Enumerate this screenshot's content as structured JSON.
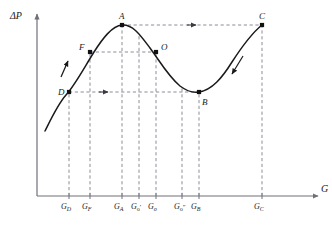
{
  "figure": {
    "axes": {
      "y_label": "ΔP",
      "x_label": "G",
      "origin_px": [
        37,
        196
      ],
      "x_axis_end_px": [
        318,
        196
      ],
      "y_axis_end_px": [
        37,
        14
      ]
    },
    "style": {
      "curve_color": "#1a1a1a",
      "dash_color": "#8c8c99",
      "axis_color": "#6f6f78",
      "point_color": "#111111",
      "background": "#ffffff"
    },
    "x_ticks": [
      {
        "name": "G_D",
        "base": "G",
        "sub": "D",
        "primes": "",
        "x_px": 69
      },
      {
        "name": "G_F",
        "base": "G",
        "sub": "F",
        "primes": "",
        "x_px": 90
      },
      {
        "name": "G_A",
        "base": "G",
        "sub": "A",
        "primes": "",
        "x_px": 122
      },
      {
        "name": "G_o'",
        "base": "G",
        "sub": "o",
        "primes": "′",
        "x_px": 139
      },
      {
        "name": "G_o",
        "base": "G",
        "sub": "o",
        "primes": "",
        "x_px": 156
      },
      {
        "name": "G_o''",
        "base": "G",
        "sub": "o",
        "primes": "″",
        "x_px": 182
      },
      {
        "name": "G_B",
        "base": "G",
        "sub": "B",
        "primes": "",
        "x_px": 199
      },
      {
        "name": "G_C",
        "base": "G",
        "sub": "C",
        "primes": "",
        "x_px": 262
      }
    ],
    "points": [
      {
        "label": "A",
        "x_px": 122,
        "y_px": 25,
        "label_dx": -3,
        "label_dy": -13
      },
      {
        "label": "C",
        "x_px": 262,
        "y_px": 25,
        "label_dx": -3,
        "label_dy": -13
      },
      {
        "label": "F",
        "x_px": 90,
        "y_px": 52,
        "label_dx": -11,
        "label_dy": -9
      },
      {
        "label": "O",
        "x_px": 156,
        "y_px": 52,
        "label_dx": 5,
        "label_dy": -9
      },
      {
        "label": "D",
        "x_px": 69,
        "y_px": 92,
        "label_dx": -11,
        "label_dy": -4
      },
      {
        "label": "B",
        "x_px": 199,
        "y_px": 92,
        "label_dx": 3,
        "label_dy": 6
      }
    ],
    "curve": {
      "description": "S-shaped van der Waals style isotherm: rising branch, local maximum at A, local minimum at B, rising branch to C",
      "path": "M 45,131 C 52,117 58,104 66,95 C 75,85 84,68 94,52 C 103,38 112,26 122,25 C 133,24 141,36 150,48 C 159,60 168,76 180,86 C 188,92 194,93 199,92 C 212,90 222,78 232,62 C 243,45 252,33 262,25"
    },
    "horizontal_connectors": [
      {
        "name": "A-to-C",
        "from_x_px": 122,
        "to_x_px": 262,
        "y_px": 25,
        "arrow": "right",
        "arrow_x_px": 196
      },
      {
        "name": "F-to-O",
        "from_x_px": 90,
        "to_x_px": 156,
        "y_px": 52,
        "arrow": "none",
        "arrow_x_px": null
      },
      {
        "name": "D-to-B",
        "from_x_px": 69,
        "to_x_px": 199,
        "y_px": 92,
        "arrow": "right",
        "arrow_x_px": 108
      }
    ],
    "vertical_droplines": [
      {
        "x_px": 69,
        "top_y_px": 92
      },
      {
        "x_px": 90,
        "top_y_px": 52
      },
      {
        "x_px": 122,
        "top_y_px": 25
      },
      {
        "x_px": 139,
        "top_y_px": 34
      },
      {
        "x_px": 156,
        "top_y_px": 52
      },
      {
        "x_px": 182,
        "top_y_px": 88
      },
      {
        "x_px": 199,
        "top_y_px": 92
      },
      {
        "x_px": 262,
        "top_y_px": 25
      }
    ],
    "tangent_arrows": [
      {
        "name": "ascending-branch-arrow",
        "direction": "up-right",
        "x1_px": 61,
        "y1_px": 77,
        "x2_px": 68,
        "y2_px": 61
      },
      {
        "name": "descending-branch-arrow",
        "direction": "down-left",
        "x1_px": 243,
        "y1_px": 56,
        "x2_px": 232,
        "y2_px": 74
      }
    ]
  }
}
